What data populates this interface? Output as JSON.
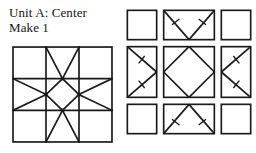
{
  "caption": {
    "line1": "Unit A: Center",
    "line2": "Make 1"
  },
  "colors": {
    "ink": "#141414",
    "paper": "#ffffff",
    "seam_line": "#1a1a1a"
  },
  "assembled_block": {
    "name": "Unit A center block",
    "grid": "3x3",
    "cells": [
      {
        "row": 0,
        "col": 0,
        "pattern": "plain-square"
      },
      {
        "row": 0,
        "col": 1,
        "pattern": "flying-geese-down"
      },
      {
        "row": 0,
        "col": 2,
        "pattern": "plain-square"
      },
      {
        "row": 1,
        "col": 0,
        "pattern": "flying-geese-right"
      },
      {
        "row": 1,
        "col": 1,
        "pattern": "square-in-square"
      },
      {
        "row": 1,
        "col": 2,
        "pattern": "flying-geese-left"
      },
      {
        "row": 2,
        "col": 0,
        "pattern": "plain-square"
      },
      {
        "row": 2,
        "col": 1,
        "pattern": "flying-geese-up"
      },
      {
        "row": 2,
        "col": 2,
        "pattern": "plain-square"
      }
    ]
  },
  "unit_grid": {
    "name": "exploded unit layout",
    "grid": "3x3",
    "cells": [
      {
        "row": 0,
        "col": 0,
        "pattern": "plain-square",
        "ticks": 0
      },
      {
        "row": 0,
        "col": 1,
        "pattern": "flying-geese-down",
        "ticks": 2
      },
      {
        "row": 0,
        "col": 2,
        "pattern": "plain-square",
        "ticks": 0
      },
      {
        "row": 1,
        "col": 0,
        "pattern": "flying-geese-right",
        "ticks": 2
      },
      {
        "row": 1,
        "col": 1,
        "pattern": "square-in-square",
        "ticks": 0
      },
      {
        "row": 1,
        "col": 2,
        "pattern": "flying-geese-left",
        "ticks": 2
      },
      {
        "row": 2,
        "col": 0,
        "pattern": "plain-square",
        "ticks": 0
      },
      {
        "row": 2,
        "col": 1,
        "pattern": "flying-geese-up",
        "ticks": 2
      },
      {
        "row": 2,
        "col": 2,
        "pattern": "plain-square",
        "ticks": 0
      }
    ]
  }
}
